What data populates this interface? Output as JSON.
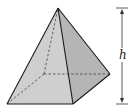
{
  "diagram": {
    "type": "square-pyramid",
    "labels": {
      "height": "h"
    },
    "colors": {
      "front_face": "#cfcfcf",
      "right_face": "#b5b5b5",
      "edge": "#1a1a1a",
      "hidden_edge": "#444444"
    },
    "vertices": {
      "apex": [
        58,
        8
      ],
      "front_left": [
        7,
        104
      ],
      "front_right": [
        73,
        104
      ],
      "back_right": [
        110,
        74
      ],
      "back_left": [
        44,
        74
      ]
    },
    "height_marker": {
      "x": 122,
      "top": 8,
      "bottom": 104
    }
  }
}
